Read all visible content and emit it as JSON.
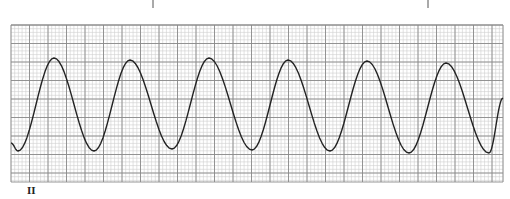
{
  "chart_data": {
    "type": "line",
    "title": "",
    "lead_label": "II",
    "grid": {
      "on": true,
      "left": 11,
      "top": 25,
      "right": 503,
      "bottom": 182,
      "major_spacing_px": 18.5,
      "minor_spacing_px": 3.7,
      "major_color": "#8a8a8a",
      "minor_color": "#cfcfcf"
    },
    "tick_marks_x": [
      153,
      428
    ],
    "trace_color": "#222222",
    "cycles": 6,
    "peaks": [
      {
        "x": 54,
        "y": 58
      },
      {
        "x": 130,
        "y": 60
      },
      {
        "x": 209,
        "y": 58
      },
      {
        "x": 288,
        "y": 60
      },
      {
        "x": 367,
        "y": 61
      },
      {
        "x": 446,
        "y": 63
      }
    ],
    "troughs": [
      {
        "x": 18,
        "y": 151
      },
      {
        "x": 94,
        "y": 151
      },
      {
        "x": 172,
        "y": 149
      },
      {
        "x": 252,
        "y": 150
      },
      {
        "x": 330,
        "y": 151
      },
      {
        "x": 409,
        "y": 153
      },
      {
        "x": 489,
        "y": 153
      }
    ],
    "start": {
      "x": 11,
      "y": 143
    },
    "end": {
      "x": 503,
      "y": 98
    },
    "xlabel": "",
    "ylabel": ""
  }
}
